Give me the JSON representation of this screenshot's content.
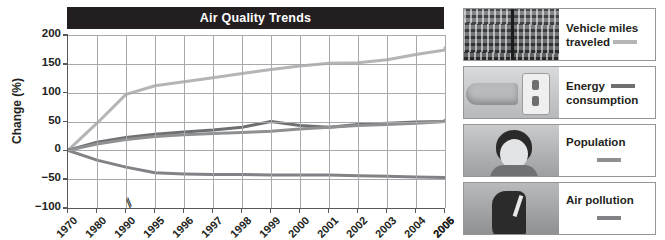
{
  "chart_data": {
    "type": "line",
    "title": "Air Quality Trends",
    "xlabel": "",
    "ylabel": "Change (%)",
    "ylim": [
      -100,
      200
    ],
    "yticks": [
      200,
      150,
      100,
      50,
      0,
      -50,
      -100
    ],
    "ytick_labels": [
      "200",
      "150",
      "100",
      "50",
      "0",
      "−50",
      "−100"
    ],
    "grid": true,
    "axis_break_after": "1990",
    "axis_break_symbol": "⁄⁄",
    "legend_position": "right",
    "categories": [
      "1970",
      "1980",
      "1990",
      "1995",
      "1996",
      "1997",
      "1998",
      "1999",
      "2000",
      "2001",
      "2002",
      "2003",
      "2004",
      "2005",
      "2006"
    ],
    "x": [
      "1970",
      "1980",
      "1990",
      "1995",
      "1996",
      "1997",
      "1998",
      "1999",
      "2000",
      "2001",
      "2002",
      "2003",
      "2004",
      "2005",
      "2006"
    ],
    "series": [
      {
        "name": "Vehicle miles traveled",
        "color": "#b3b5b7",
        "values": [
          0,
          47,
          97,
          112,
          119,
          126,
          133,
          140,
          146,
          151,
          152,
          157,
          166,
          174,
          178
        ]
      },
      {
        "name": "Energy consumption",
        "color": "#6d6f71",
        "values": [
          0,
          14,
          22,
          28,
          32,
          35,
          40,
          50,
          43,
          40,
          45,
          47,
          49,
          50,
          52
        ]
      },
      {
        "name": "Population",
        "color": "#8e9092",
        "values": [
          0,
          11,
          19,
          24,
          27,
          29,
          31,
          33,
          37,
          40,
          43,
          45,
          47,
          50,
          52
        ]
      },
      {
        "name": "Air pollution",
        "color": "#808285",
        "values": [
          0,
          -17,
          -29,
          -39,
          -41,
          -42,
          -42,
          -43,
          -43,
          -43,
          -44,
          -45,
          -46,
          -47,
          -49
        ]
      }
    ]
  },
  "chart": {
    "title": "Air Quality Trends",
    "y_axis_label": "Change (%)",
    "y_tick_labels": [
      "200",
      "150",
      "100",
      "50",
      "0",
      "−50",
      "−100"
    ],
    "x_tick_labels": [
      "1970",
      "1980",
      "1990",
      "1995",
      "1996",
      "1997",
      "1998",
      "1999",
      "2000",
      "2001",
      "2002",
      "2003",
      "2004",
      "2005",
      "2006"
    ],
    "axis_break": "⁄⁄"
  },
  "legend": {
    "items": [
      {
        "label": "Vehicle miles traveled",
        "color": "#b3b5b7",
        "thumbnail": "traffic-photo"
      },
      {
        "label": "Energy consumption",
        "color": "#6d6f71",
        "thumbnail": "electrical-outlet-photo"
      },
      {
        "label": "Population",
        "color": "#8e9092",
        "thumbnail": "baby-photo"
      },
      {
        "label": "Air pollution",
        "color": "#808285",
        "thumbnail": "cigarette-smoke-photo"
      }
    ]
  },
  "colors": {
    "title_bar": "#231f20",
    "grid": "#a7a9ac",
    "axis": "#58595b"
  }
}
